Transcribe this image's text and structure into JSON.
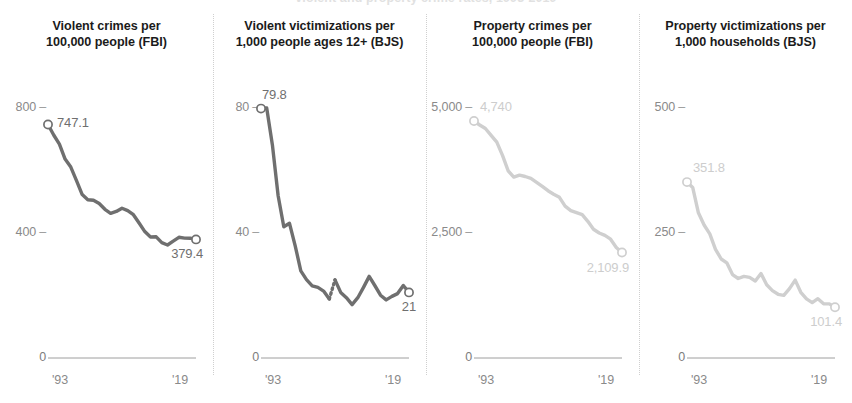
{
  "clipped_header": "violent and property crime rates, 1993-2019",
  "axis": {
    "x_start_label": "'93",
    "x_end_label": "'19",
    "zero_label": "0"
  },
  "chart_data": [
    {
      "type": "line",
      "panel_index": 1,
      "title_lines": [
        "Violent crimes per",
        "100,000 people (FBI)"
      ],
      "source": "FBI",
      "series_color": "#6f6f6f",
      "label_color": "#6f6f6f",
      "xlabel": "",
      "ylabel": "",
      "xlim": [
        1993,
        2019
      ],
      "ylim": [
        0,
        900
      ],
      "yticks": [
        400,
        800
      ],
      "ytick_labels": [
        "400",
        "250-placeholder",
        "800"
      ],
      "y_axis_ticks": [
        {
          "value": 800,
          "label": "800"
        },
        {
          "value": 400,
          "label": "400"
        },
        {
          "value": 0,
          "label": "0"
        }
      ],
      "xticks": [
        1993,
        2019
      ],
      "xtick_labels": [
        "'93",
        "'19"
      ],
      "start_label": "747.1",
      "end_label": "379.4",
      "grid": false,
      "x": [
        1993,
        1994,
        1995,
        1996,
        1997,
        1998,
        1999,
        2000,
        2001,
        2002,
        2003,
        2004,
        2005,
        2006,
        2007,
        2008,
        2009,
        2010,
        2011,
        2012,
        2013,
        2014,
        2015,
        2016,
        2017,
        2018,
        2019
      ],
      "values": [
        747.1,
        713.6,
        684.5,
        636.6,
        611.0,
        567.6,
        523.0,
        506.5,
        504.5,
        494.4,
        475.8,
        463.2,
        469.0,
        479.3,
        471.8,
        458.6,
        431.9,
        404.5,
        387.1,
        387.8,
        369.1,
        361.6,
        373.7,
        386.3,
        383.8,
        383.4,
        379.4
      ]
    },
    {
      "type": "line",
      "panel_index": 2,
      "title_lines": [
        "Violent victimizations per",
        "1,000 people ages 12+ (BJS)"
      ],
      "source": "BJS",
      "series_color": "#6f6f6f",
      "label_color": "#6f6f6f",
      "xlabel": "",
      "ylabel": "",
      "xlim": [
        1993,
        2019
      ],
      "ylim": [
        0,
        90
      ],
      "y_axis_ticks": [
        {
          "value": 80,
          "label": "80"
        },
        {
          "value": 40,
          "label": "40"
        },
        {
          "value": 0,
          "label": "0"
        }
      ],
      "xticks": [
        1993,
        2019
      ],
      "xtick_labels": [
        "'93",
        "'19"
      ],
      "start_label": "79.8",
      "end_label": "21",
      "grid": false,
      "has_dotted_break": true,
      "dotted_break_years": [
        2005,
        2006
      ],
      "x": [
        1993,
        1994,
        1995,
        1996,
        1997,
        1998,
        1999,
        2000,
        2001,
        2002,
        2003,
        2004,
        2005,
        2006,
        2007,
        2008,
        2009,
        2010,
        2011,
        2012,
        2013,
        2014,
        2015,
        2016,
        2017,
        2018,
        2019
      ],
      "values": [
        79.8,
        80.0,
        68.2,
        52.0,
        42.0,
        43.1,
        35.9,
        27.9,
        25.1,
        23.1,
        22.6,
        21.4,
        18.9,
        25.0,
        21.0,
        19.3,
        17.1,
        19.3,
        22.6,
        26.1,
        23.2,
        20.1,
        18.6,
        19.7,
        20.6,
        23.2,
        21.0
      ]
    },
    {
      "type": "line",
      "panel_index": 3,
      "title_lines": [
        "Property crimes per",
        "100,000 people (FBI)"
      ],
      "source": "FBI",
      "series_color": "#cfcfcf",
      "label_color": "#cdcdcd",
      "xlabel": "",
      "ylabel": "",
      "xlim": [
        1993,
        2019
      ],
      "ylim": [
        0,
        5600
      ],
      "y_axis_ticks": [
        {
          "value": 5000,
          "label": "5,000"
        },
        {
          "value": 2500,
          "label": "2,500"
        },
        {
          "value": 0,
          "label": "0"
        }
      ],
      "xticks": [
        1993,
        2019
      ],
      "xtick_labels": [
        "'93",
        "'19"
      ],
      "start_label": "4,740",
      "end_label": "2,109.9",
      "grid": false,
      "x": [
        1993,
        1994,
        1995,
        1996,
        1997,
        1998,
        1999,
        2000,
        2001,
        2002,
        2003,
        2004,
        2005,
        2006,
        2007,
        2008,
        2009,
        2010,
        2011,
        2012,
        2013,
        2014,
        2015,
        2016,
        2017,
        2018,
        2019
      ],
      "values": [
        4740.0,
        4660.2,
        4590.5,
        4451.0,
        4316.3,
        4052.5,
        3743.6,
        3618.3,
        3658.1,
        3630.6,
        3591.2,
        3514.1,
        3431.5,
        3346.6,
        3276.4,
        3214.6,
        3036.1,
        2945.9,
        2905.4,
        2868.0,
        2733.6,
        2574.1,
        2500.5,
        2451.6,
        2376.0,
        2209.8,
        2109.9
      ]
    },
    {
      "type": "line",
      "panel_index": 4,
      "title_lines": [
        "Property victimizations per",
        "1,000 households (BJS)"
      ],
      "source": "BJS",
      "series_color": "#cfcfcf",
      "label_color": "#cdcdcd",
      "xlabel": "",
      "ylabel": "",
      "xlim": [
        1993,
        2019
      ],
      "ylim": [
        0,
        560
      ],
      "y_axis_ticks": [
        {
          "value": 500,
          "label": "500"
        },
        {
          "value": 250,
          "label": "250"
        },
        {
          "value": 0,
          "label": "0"
        }
      ],
      "xticks": [
        1993,
        2019
      ],
      "xtick_labels": [
        "'93",
        "'19"
      ],
      "start_label": "351.8",
      "end_label": "101.4",
      "grid": false,
      "x": [
        1993,
        1994,
        1995,
        1996,
        1997,
        1998,
        1999,
        2000,
        2001,
        2002,
        2003,
        2004,
        2005,
        2006,
        2007,
        2008,
        2009,
        2010,
        2011,
        2012,
        2013,
        2014,
        2015,
        2016,
        2017,
        2018,
        2019
      ],
      "values": [
        351.8,
        341.2,
        290.5,
        266.0,
        248.3,
        217.4,
        198.0,
        190.4,
        166.9,
        159.0,
        163.2,
        161.1,
        154.0,
        169.0,
        146.5,
        134.7,
        127.4,
        125.4,
        138.7,
        155.8,
        131.4,
        118.1,
        110.7,
        118.6,
        108.4,
        108.2,
        101.4
      ]
    }
  ]
}
